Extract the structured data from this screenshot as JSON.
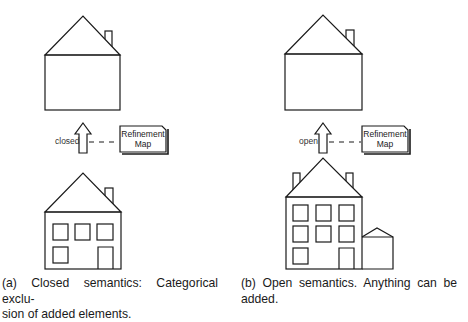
{
  "panels": [
    {
      "id": "a",
      "arrow_label": "closed",
      "refinement_map": {
        "line1": "Refinement",
        "line2": "Map"
      },
      "caption": "(a) Closed semantics: Categorical exclusion of added elements.",
      "caption_line1": "(a) Closed semantics:  Categorical exclu-",
      "caption_line2": "sion of added elements.",
      "top_house": {
        "windows": 0,
        "chimneys": 1
      },
      "bottom_house": {
        "windows": 4,
        "doors": 1,
        "chimneys": 1
      }
    },
    {
      "id": "b",
      "arrow_label": "open",
      "refinement_map": {
        "line1": "Refinement",
        "line2": "Map"
      },
      "caption": "(b) Open semantics. Anything can be added.",
      "caption_line1": "(b) Open semantics.   Anything can be",
      "caption_line2": "added.",
      "top_house": {
        "windows": 0,
        "chimneys": 1
      },
      "bottom_house": {
        "windows": 7,
        "doors": 1,
        "chimneys": 2,
        "annex": true
      }
    }
  ],
  "colors": {
    "stroke": "#1a1a1a",
    "background": "#ffffff"
  }
}
